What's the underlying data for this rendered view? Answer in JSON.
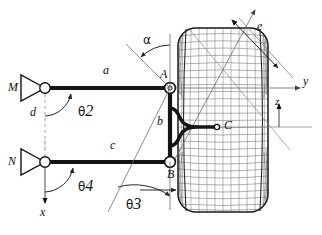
{
  "figure": {
    "type": "mechanism-kinematic-diagram"
  },
  "colors": {
    "ink": "#111111",
    "link": "#1a1a1a",
    "thin": "#555555",
    "mesh": "#6a6a6a",
    "mesh_light": "#8c8c8c",
    "dash": "#9a9a9a",
    "background": "#ffffff"
  },
  "joints": [
    {
      "id": "M",
      "label": "M",
      "x": 45,
      "y": 88,
      "kind": "ground-pivot"
    },
    {
      "id": "N",
      "label": "N",
      "x": 45,
      "y": 162,
      "kind": "ground-pivot"
    },
    {
      "id": "A",
      "label": "A",
      "x": 170,
      "y": 88,
      "kind": "pin-joint"
    },
    {
      "id": "B",
      "label": "B",
      "x": 170,
      "y": 162,
      "kind": "pin-joint"
    },
    {
      "id": "C",
      "label": "C",
      "x": 218,
      "y": 127,
      "kind": "point"
    }
  ],
  "links": [
    {
      "id": "a",
      "label": "a",
      "from": "M",
      "to": "A",
      "label_x": 103,
      "label_y": 71
    },
    {
      "id": "c",
      "label": "c",
      "from": "N",
      "to": "B",
      "label_x": 110,
      "label_y": 146
    },
    {
      "id": "b",
      "label": "b",
      "from": "A",
      "to": "B",
      "label_x": 160,
      "label_y": 120
    }
  ],
  "dimensions": [
    {
      "id": "d",
      "label": "d",
      "label_x": 33,
      "label_y": 112,
      "note": "vertical offset M to N"
    },
    {
      "id": "e",
      "label": "e",
      "label_x": 258,
      "label_y": 27,
      "note": "offset along diagonal"
    }
  ],
  "angles": [
    {
      "id": "theta2",
      "label": "θ",
      "sub": "2",
      "label_x": 82,
      "label_y": 108,
      "at": "M"
    },
    {
      "id": "theta4",
      "label": "θ",
      "sub": "4",
      "label_x": 82,
      "label_y": 184,
      "at": "N"
    },
    {
      "id": "theta3",
      "label": "θ",
      "sub": "3",
      "label_x": 130,
      "label_y": 200,
      "at": "B"
    },
    {
      "id": "alpha",
      "label": "α",
      "sub": "",
      "label_x": 146,
      "label_y": 36,
      "at": "A"
    }
  ],
  "axes": [
    {
      "id": "y",
      "label": "y",
      "label_x": 305,
      "label_y": 80,
      "direction": "right",
      "origin_x": 170,
      "origin_y": 88
    },
    {
      "id": "z",
      "label": "z",
      "label_x": 276,
      "label_y": 101,
      "direction": "up",
      "origin_x": 279,
      "origin_y": 127
    },
    {
      "id": "x",
      "label": "x",
      "label_x": 41,
      "label_y": 212,
      "direction": "down",
      "origin_x": 45,
      "origin_y": 162
    }
  ],
  "wheel": {
    "id": "tire",
    "name": "tire-wireframe",
    "left": 178,
    "right": 268,
    "top": 28,
    "bottom": 212,
    "corner": 18,
    "rows": 26,
    "cols": 11
  }
}
